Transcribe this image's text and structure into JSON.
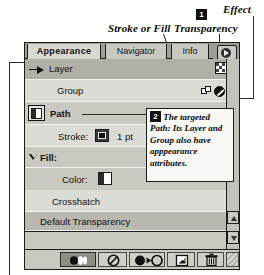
{
  "annotations": {
    "stroke_or_fill": "Stroke or Fill",
    "transparency": "Transparency",
    "effect": "Effect",
    "badge_one": "1",
    "badge_two": "2",
    "callout_text": "The targeted Path: Its Layer and Group also have apppearance attributes."
  },
  "palette": {
    "tabs": [
      {
        "label": "Appearance",
        "active": true
      },
      {
        "label": "Navigator",
        "active": false
      },
      {
        "label": "Info",
        "active": false
      }
    ],
    "menu_button": "palette-menu-button",
    "rows": [
      {
        "label": "Layer",
        "kind": "layer"
      },
      {
        "label": "Group",
        "kind": "group"
      },
      {
        "label": "Path",
        "kind": "path"
      },
      {
        "label": "Stroke:",
        "value": "1 pt",
        "kind": "stroke"
      },
      {
        "label": "Fill:",
        "kind": "fill"
      },
      {
        "label": "Color:",
        "kind": "color"
      },
      {
        "label": "Crosshatch",
        "kind": "effect"
      },
      {
        "label": "Default Transparency",
        "kind": "transparency"
      }
    ],
    "toolbar": [
      {
        "name": "new-art-maintains-appearance-button",
        "icon": "appearance-dots-icon",
        "state": "pressed"
      },
      {
        "name": "clear-appearance-button",
        "icon": "no-symbol-icon",
        "state": "normal"
      },
      {
        "name": "reduce-to-basic-appearance-button",
        "icon": "circle-arrow-circle-icon",
        "state": "normal"
      },
      {
        "name": "duplicate-selected-item-button",
        "icon": "duplicate-page-icon",
        "state": "normal"
      },
      {
        "name": "delete-selected-item-button",
        "icon": "trash-icon",
        "state": "normal"
      },
      {
        "name": "resize-grip",
        "icon": "grip-hatch-icon",
        "state": "grip"
      }
    ],
    "scrollbar": {
      "up": "scroll-up-arrow-icon",
      "down": "scroll-down-arrow-icon"
    },
    "colors": {
      "panel_face": "#c9c9c2",
      "row_light": "#dcdcd6",
      "row_dark": "#b0b0a9",
      "tabstrip": "#9e9e98",
      "border": "#1c1c1c",
      "callout_bg": "#f7f7f4"
    }
  }
}
